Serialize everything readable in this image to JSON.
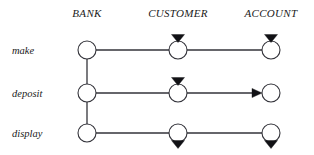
{
  "diagram": {
    "type": "interaction-diagram",
    "background_color": "#ffffff",
    "line_color": "#33333a",
    "marker_color": "#111115",
    "text_color": "#1a1a1a",
    "columns": [
      {
        "id": "bank",
        "label": "BANK",
        "x": 87,
        "header_x": 87,
        "header_y": 17
      },
      {
        "id": "customer",
        "label": "CUSTOMER",
        "x": 178,
        "header_x": 178,
        "header_y": 17
      },
      {
        "id": "account",
        "label": "ACCOUNT",
        "x": 271,
        "header_x": 271,
        "header_y": 17
      }
    ],
    "rows": [
      {
        "id": "make",
        "label": "make",
        "label_x": 12,
        "label_y": 54,
        "y": 50
      },
      {
        "id": "deposit",
        "label": "deposit",
        "label_x": 12,
        "label_y": 97,
        "y": 93
      },
      {
        "id": "display",
        "label": "display",
        "label_x": 12,
        "label_y": 137,
        "y": 133
      }
    ],
    "node_radius": 9,
    "nodes": [
      {
        "row": "make",
        "column": "bank",
        "cx": 87,
        "cy": 50,
        "marker": "none"
      },
      {
        "row": "make",
        "column": "customer",
        "cx": 178,
        "cy": 50,
        "marker": "triangle-above"
      },
      {
        "row": "make",
        "column": "account",
        "cx": 271,
        "cy": 50,
        "marker": "triangle-above"
      },
      {
        "row": "deposit",
        "column": "bank",
        "cx": 87,
        "cy": 93,
        "marker": "none"
      },
      {
        "row": "deposit",
        "column": "customer",
        "cx": 178,
        "cy": 93,
        "marker": "triangle-above"
      },
      {
        "row": "deposit",
        "column": "account",
        "cx": 271,
        "cy": 93,
        "marker": "none"
      },
      {
        "row": "display",
        "column": "bank",
        "cx": 87,
        "cy": 133,
        "marker": "none"
      },
      {
        "row": "display",
        "column": "customer",
        "cx": 178,
        "cy": 133,
        "marker": "triangle-below"
      },
      {
        "row": "display",
        "column": "account",
        "cx": 271,
        "cy": 133,
        "marker": "triangle-below"
      }
    ],
    "links": [
      {
        "row": "make",
        "from": "bank",
        "to": "customer",
        "x1": 96,
        "x2": 169,
        "y": 50,
        "arrow": false
      },
      {
        "row": "make",
        "from": "customer",
        "to": "account",
        "x1": 187,
        "x2": 262,
        "y": 50,
        "arrow": false
      },
      {
        "row": "deposit",
        "from": "bank",
        "to": "customer",
        "x1": 96,
        "x2": 169,
        "y": 93,
        "arrow": false
      },
      {
        "row": "deposit",
        "from": "customer",
        "to": "account",
        "x1": 187,
        "x2": 262,
        "y": 93,
        "arrow": true
      },
      {
        "row": "display",
        "from": "bank",
        "to": "customer",
        "x1": 96,
        "x2": 169,
        "y": 133,
        "arrow": false
      },
      {
        "row": "display",
        "from": "customer",
        "to": "account",
        "x1": 187,
        "x2": 262,
        "y": 133,
        "arrow": false
      }
    ],
    "lifelines": [
      {
        "column": "bank",
        "x": 87,
        "y1": 59,
        "y2": 84
      },
      {
        "column": "bank",
        "x": 87,
        "y1": 102,
        "y2": 124
      }
    ]
  }
}
